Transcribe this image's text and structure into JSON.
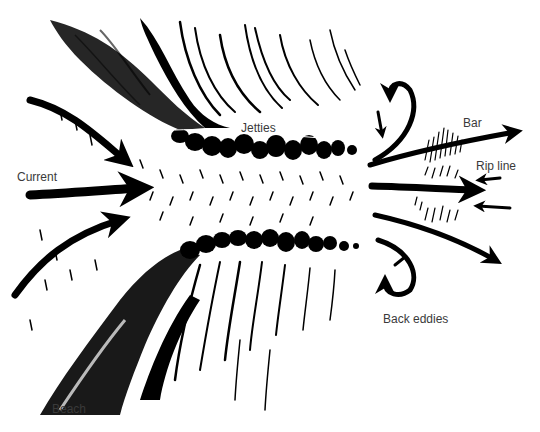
{
  "diagram": {
    "type": "jetty rip current illustration",
    "colors": {
      "ink": "#000000",
      "background": "#ffffff",
      "label": "#3a3a3a"
    },
    "labels": {
      "jetties": "Jetties",
      "current": "Current",
      "bar": "Bar",
      "rip_line": "Rip line",
      "back_eddies": "Back eddies",
      "beach": "Beach"
    }
  }
}
